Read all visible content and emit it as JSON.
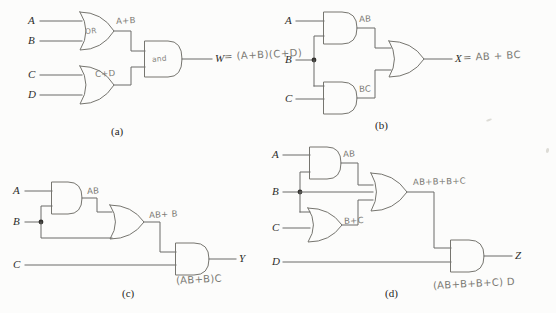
{
  "figure": {
    "background_color": "#fcfcfb",
    "ink_color": "#6a6a68",
    "pencil_color": "#7b7a74"
  },
  "circuits": [
    {
      "id": "a",
      "caption": "(a)",
      "inputs": [
        "A",
        "B",
        "C",
        "D"
      ],
      "output": "W",
      "gates": [
        {
          "type": "OR",
          "inscription": "OR",
          "output_label": "A+B"
        },
        {
          "type": "OR",
          "inscription": "",
          "output_label": "C+D"
        },
        {
          "type": "AND",
          "inscription": "and",
          "output_label": ""
        }
      ],
      "output_expression": "W = (A+B)(C+D)"
    },
    {
      "id": "b",
      "caption": "(b)",
      "inputs": [
        "A",
        "B",
        "C"
      ],
      "output": "X",
      "gates": [
        {
          "type": "AND",
          "inscription": "",
          "output_label": "AB"
        },
        {
          "type": "AND",
          "inscription": "",
          "output_label": "BC"
        },
        {
          "type": "OR",
          "inscription": "",
          "output_label": ""
        }
      ],
      "output_expression": "X = AB + BC"
    },
    {
      "id": "c",
      "caption": "(c)",
      "inputs": [
        "A",
        "B",
        "C"
      ],
      "output": "Y",
      "gates": [
        {
          "type": "AND",
          "inscription": "",
          "output_label": "AB"
        },
        {
          "type": "OR",
          "inscription": "",
          "output_label": "AB+ B"
        },
        {
          "type": "AND",
          "inscription": "",
          "output_label": ""
        }
      ],
      "output_expression": "(AB+B)C"
    },
    {
      "id": "d",
      "caption": "(d)",
      "inputs": [
        "A",
        "B",
        "C",
        "D"
      ],
      "output": "Z",
      "gates": [
        {
          "type": "AND",
          "inscription": "",
          "output_label": "AB"
        },
        {
          "type": "OR",
          "inscription": "",
          "output_label": "B+C"
        },
        {
          "type": "OR",
          "inscription": "",
          "output_label": "AB+B+B+C"
        },
        {
          "type": "AND",
          "inscription": "",
          "output_label": ""
        }
      ],
      "output_expression": "(AB+B+B+C) D"
    }
  ],
  "labels": {
    "a": {
      "in_a": "A",
      "in_b": "B",
      "in_c": "C",
      "in_d": "D",
      "or1_name": "OR",
      "or1_out": "A+B",
      "or2_out": "C+D",
      "and_name": "and",
      "out_name": "W",
      "out_expr": "= (A+B)(C+D)",
      "caption": "(a)"
    },
    "b": {
      "in_a": "A",
      "in_b": "B",
      "in_c": "C",
      "and1_out": "AB",
      "and2_out": "BC",
      "out_name": "X",
      "out_expr": "= AB + BC",
      "caption": "(b)"
    },
    "c": {
      "in_a": "A",
      "in_b": "B",
      "in_c": "C",
      "and1_out": "AB",
      "or1_out": "AB+ B",
      "out_name": "Y",
      "out_expr": "(AB+B)C",
      "caption": "(c)"
    },
    "d": {
      "in_a": "A",
      "in_b": "B",
      "in_c": "C",
      "in_d": "D",
      "and1_out": "AB",
      "or1_out": "B+C",
      "or2_out": "AB+B+B+C",
      "out_name": "Z",
      "out_expr": "(AB+B+B+C) D",
      "caption": "(d)"
    }
  }
}
